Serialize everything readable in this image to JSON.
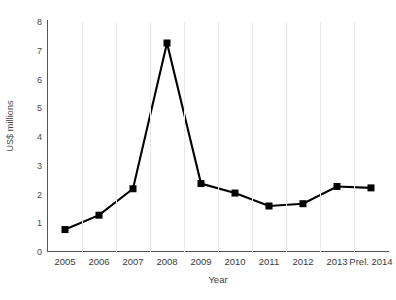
{
  "chart_data": {
    "type": "line",
    "title": "",
    "xlabel": "Year",
    "ylabel": "US$ millions",
    "categories": [
      "2005",
      "2006",
      "2007",
      "2008",
      "2009",
      "2010",
      "2011",
      "2012",
      "2013",
      "Prel. 2014"
    ],
    "values": [
      0.78,
      1.28,
      2.2,
      7.27,
      2.38,
      2.05,
      1.6,
      1.68,
      2.28,
      2.23
    ],
    "ylim": [
      0,
      8
    ],
    "yticks": [
      0,
      1,
      2,
      3,
      4,
      5,
      6,
      7,
      8
    ],
    "ytick_labels": [
      "0",
      "1",
      "2",
      "3",
      "4",
      "5",
      "6",
      "7",
      "8"
    ],
    "grid": "vertical",
    "legend": "none",
    "series_color": "#000000",
    "marker": "square",
    "axis_color": "#555555",
    "gridline_color": "#e9e9e9",
    "background_color": "#ffffff"
  }
}
